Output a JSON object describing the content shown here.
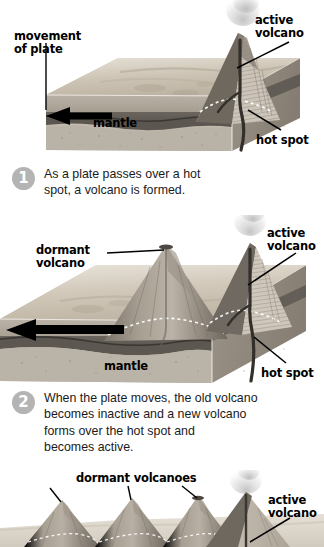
{
  "figure": {
    "topic": "Hot spot volcano formation over a moving tectonic plate",
    "panels": [
      {
        "id": "panel-1",
        "step": "1",
        "caption": "As a plate passes over a hot\nspot, a volcano is formed.",
        "labels": [
          {
            "name": "movement-of-plate",
            "text": "movement\nof plate"
          },
          {
            "name": "active-volcano",
            "text": "active\nvolcano"
          },
          {
            "name": "mantle",
            "text": "mantle"
          },
          {
            "name": "hot-spot",
            "text": "hot spot"
          }
        ]
      },
      {
        "id": "panel-2",
        "step": "2",
        "caption": "When the plate moves, the old volcano\nbecomes inactive and a new volcano\nforms over the hot spot and\nbecomes active.",
        "labels": [
          {
            "name": "dormant-volcano",
            "text": "dormant\nvolcano"
          },
          {
            "name": "active-volcano",
            "text": "active\nvolcano"
          },
          {
            "name": "mantle",
            "text": "mantle"
          },
          {
            "name": "hot-spot",
            "text": "hot spot"
          }
        ]
      },
      {
        "id": "panel-3",
        "step": "",
        "caption": "",
        "labels": [
          {
            "name": "dormant-volcanoes",
            "text": "dormant volcanoes"
          },
          {
            "name": "active-volcano",
            "text": "active\nvolcano"
          }
        ]
      }
    ]
  },
  "colors": {
    "ink": "#000000",
    "caption_text": "#1b1b1b",
    "step_badge": "#b4b4b4",
    "step_badge_text": "#ffffff",
    "sky": "#ffffff",
    "plate_top": "#c9bfb0",
    "plate_top_light": "#dcd5c9",
    "crust_face": "#9a9186",
    "crust_dark_band": "#5e5a55",
    "mantle_face": "#bdb6ab",
    "mantle_side": "#a49c90",
    "volcano_light": "#b9b2a7",
    "volcano_mid": "#8e867b",
    "volcano_dark": "#615b53",
    "conduit": "#3a3632",
    "plume": "#cfcfcf"
  }
}
